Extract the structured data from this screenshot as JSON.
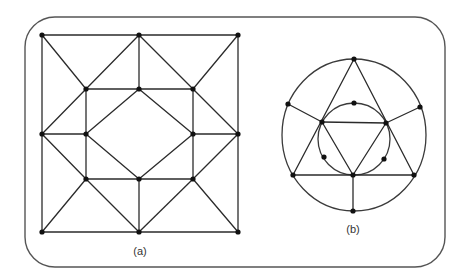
{
  "figure": {
    "frame": {
      "x": 25,
      "y": 17,
      "width": 420,
      "height": 250,
      "radius": 30
    },
    "colors": {
      "stroke": "#2b2b2b",
      "vertex": "#111111",
      "frame": "#555555"
    },
    "graph_a": {
      "label": "(a)",
      "label_pos": [
        140,
        255
      ],
      "vertices": [
        [
          42,
          35
        ],
        [
          139,
          35
        ],
        [
          238,
          35
        ],
        [
          86,
          89
        ],
        [
          139,
          89
        ],
        [
          193,
          89
        ],
        [
          42,
          134
        ],
        [
          86,
          134
        ],
        [
          193,
          134
        ],
        [
          238,
          134
        ],
        [
          86,
          179
        ],
        [
          139,
          179
        ],
        [
          193,
          179
        ],
        [
          42,
          232
        ],
        [
          139,
          232
        ],
        [
          238,
          232
        ]
      ],
      "edges": [
        [
          0,
          1
        ],
        [
          1,
          2
        ],
        [
          0,
          6
        ],
        [
          6,
          13
        ],
        [
          2,
          9
        ],
        [
          9,
          15
        ],
        [
          13,
          14
        ],
        [
          14,
          15
        ],
        [
          0,
          3
        ],
        [
          1,
          3
        ],
        [
          1,
          4
        ],
        [
          1,
          5
        ],
        [
          2,
          5
        ],
        [
          3,
          4
        ],
        [
          4,
          5
        ],
        [
          3,
          7
        ],
        [
          7,
          10
        ],
        [
          5,
          8
        ],
        [
          8,
          12
        ],
        [
          10,
          11
        ],
        [
          11,
          12
        ],
        [
          3,
          6
        ],
        [
          5,
          9
        ],
        [
          6,
          7
        ],
        [
          8,
          9
        ],
        [
          4,
          7
        ],
        [
          4,
          8
        ],
        [
          7,
          11
        ],
        [
          8,
          11
        ],
        [
          6,
          10
        ],
        [
          9,
          12
        ],
        [
          10,
          13
        ],
        [
          10,
          14
        ],
        [
          12,
          14
        ],
        [
          12,
          15
        ],
        [
          11,
          14
        ]
      ]
    },
    "graph_b": {
      "label": "(b)",
      "label_pos": [
        353,
        233
      ],
      "outer_circle": {
        "cx": 354,
        "cy": 135,
        "rx": 72,
        "ry": 76
      },
      "inner_circle": {
        "cx": 354,
        "cy": 139,
        "r": 36
      },
      "vertices": [
        [
          354,
          59
        ],
        [
          288,
          104
        ],
        [
          420,
          107
        ],
        [
          322,
          122
        ],
        [
          386,
          123
        ],
        [
          354,
          103
        ],
        [
          324,
          157
        ],
        [
          384,
          159
        ],
        [
          293,
          175
        ],
        [
          353,
          175
        ],
        [
          414,
          175
        ],
        [
          353,
          211
        ]
      ],
      "edges": [
        [
          0,
          8
        ],
        [
          0,
          10
        ],
        [
          8,
          10
        ],
        [
          3,
          4
        ],
        [
          3,
          9
        ],
        [
          4,
          9
        ],
        [
          1,
          3
        ],
        [
          2,
          4
        ],
        [
          9,
          11
        ]
      ]
    }
  }
}
